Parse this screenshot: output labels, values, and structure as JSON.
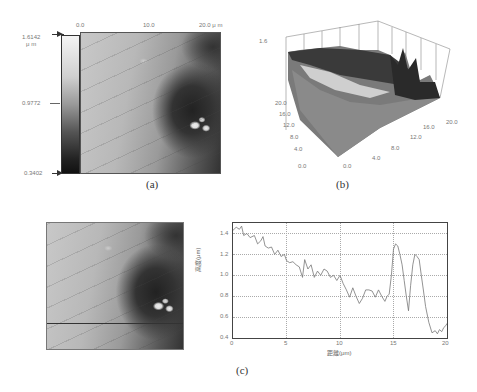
{
  "panel_a": {
    "caption": "(a)",
    "x_ticks": [
      "0.0",
      "10.0",
      "20.0 μ m"
    ],
    "colorbar": {
      "max": "1.6142",
      "unit": "μ m",
      "mid": "0.9772",
      "min": "0.3402"
    }
  },
  "panel_b": {
    "caption": "(b)",
    "z_tick": "1.6",
    "left_axis_ticks": [
      "20.0",
      "16.0",
      "12.0",
      "8.0",
      "4.0",
      "0.0"
    ],
    "right_axis_ticks": [
      "0.0",
      "4.0",
      "8.0",
      "12.0",
      "16.0",
      "20.0"
    ]
  },
  "panel_c": {
    "caption": "(c)",
    "image_title": "",
    "chart_title": ""
  },
  "chart_data": {
    "type": "line",
    "title": "",
    "xlabel": "距離(μm)",
    "ylabel": "高度(μm)",
    "xlim": [
      0,
      20
    ],
    "ylim": [
      0.4,
      1.5
    ],
    "x_ticks": [
      "0",
      "5",
      "10",
      "15",
      "20"
    ],
    "y_ticks": [
      "0.4",
      "0.6",
      "0.8",
      "1.0",
      "1.2",
      "1.4"
    ],
    "grid": true,
    "series": [
      {
        "name": "profile",
        "x": [
          0,
          0.3,
          0.6,
          0.8,
          1.0,
          1.3,
          1.6,
          2.0,
          2.3,
          2.6,
          2.8,
          3.0,
          3.3,
          3.6,
          3.9,
          4.2,
          4.5,
          4.8,
          5.0,
          5.3,
          5.6,
          5.9,
          6.2,
          6.5,
          6.7,
          7.0,
          7.3,
          7.6,
          7.9,
          8.2,
          8.5,
          8.8,
          9.1,
          9.4,
          9.7,
          10.0,
          10.3,
          10.6,
          10.9,
          11.2,
          11.5,
          11.8,
          12.1,
          12.4,
          12.7,
          13.0,
          13.3,
          13.6,
          13.9,
          14.2,
          14.4,
          14.6,
          14.8,
          15.0,
          15.2,
          15.4,
          15.6,
          15.8,
          16.0,
          16.2,
          16.4,
          16.6,
          16.8,
          17.0,
          17.2,
          17.4,
          17.6,
          17.8,
          18.0,
          18.3,
          18.6,
          18.9,
          19.1,
          19.3,
          19.5,
          19.7,
          19.9,
          20.0
        ],
        "values": [
          1.43,
          1.46,
          1.44,
          1.47,
          1.38,
          1.4,
          1.36,
          1.38,
          1.3,
          1.33,
          1.37,
          1.28,
          1.26,
          1.27,
          1.2,
          1.24,
          1.18,
          1.2,
          1.14,
          1.12,
          1.13,
          1.1,
          1.08,
          0.98,
          1.15,
          1.06,
          1.1,
          0.98,
          1.04,
          1.0,
          1.06,
          1.04,
          0.98,
          1.0,
          0.95,
          1.0,
          0.92,
          0.86,
          0.79,
          0.88,
          0.8,
          0.73,
          0.78,
          0.86,
          0.86,
          0.85,
          0.79,
          0.86,
          0.8,
          0.75,
          0.8,
          0.82,
          1.0,
          1.25,
          1.3,
          1.28,
          1.2,
          1.1,
          0.95,
          0.8,
          0.66,
          0.9,
          1.1,
          1.2,
          1.18,
          1.15,
          1.0,
          0.85,
          0.7,
          0.55,
          0.45,
          0.47,
          0.44,
          0.48,
          0.46,
          0.5,
          0.52,
          0.54
        ]
      }
    ]
  }
}
